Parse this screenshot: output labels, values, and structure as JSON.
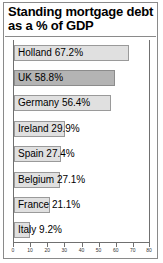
{
  "chart_data": {
    "type": "bar",
    "orientation": "horizontal",
    "title": "Standing mortgage debt as a % of GDP",
    "xlabel": "",
    "ylabel": "",
    "xlim": [
      0,
      80
    ],
    "grid": false,
    "legend": false,
    "categories": [
      "Holland",
      "UK",
      "Germany",
      "Ireland",
      "Spain",
      "Belgium",
      "France",
      "Italy"
    ],
    "values": [
      67.2,
      58.8,
      56.4,
      29.9,
      27.4,
      27.1,
      21.1,
      9.2
    ],
    "bar_labels": [
      "Holland 67.2%",
      "UK 58.8%",
      "Germany 56.4%",
      "Ireland 29.9%",
      "Spain 27.4%",
      "Belgium 27.1%",
      "France 21.1%",
      "Italy 9.2%"
    ],
    "highlighted": [
      "UK"
    ],
    "xticks": [
      0,
      10,
      20,
      30,
      40,
      50,
      60,
      70,
      80
    ],
    "xtick_labels": [
      "0",
      "10",
      "20",
      "30",
      "40",
      "50",
      "60",
      "70",
      "80"
    ],
    "colors": {
      "bar_fill": "#e0e0e0",
      "bar_highlight_fill": "#b4b4b4",
      "bar_edge": "#9a9a9a",
      "axis": "#707070",
      "frame": "#8a8a8a",
      "text": "#000000",
      "background": "#ffffff"
    }
  }
}
